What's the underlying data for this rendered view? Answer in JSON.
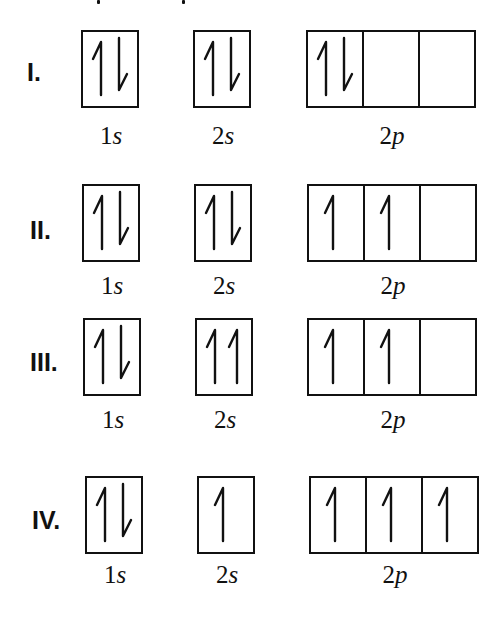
{
  "diagram": {
    "type": "orbital-box-diagram",
    "orbital_labels": [
      {
        "num": "1",
        "sub": "s"
      },
      {
        "num": "2",
        "sub": "s"
      },
      {
        "num": "2",
        "sub": "p"
      }
    ],
    "rows": [
      {
        "label": "I.",
        "orbitals": {
          "1s": [
            [
              "up",
              "down"
            ]
          ],
          "2s": [
            [
              "up",
              "down"
            ]
          ],
          "2p": [
            [
              "up",
              "down"
            ],
            [],
            []
          ]
        }
      },
      {
        "label": "II.",
        "orbitals": {
          "1s": [
            [
              "up",
              "down"
            ]
          ],
          "2s": [
            [
              "up",
              "down"
            ]
          ],
          "2p": [
            [
              "up"
            ],
            [
              "up"
            ],
            []
          ]
        }
      },
      {
        "label": "III.",
        "orbitals": {
          "1s": [
            [
              "up",
              "down"
            ]
          ],
          "2s": [
            [
              "up",
              "up"
            ]
          ],
          "2p": [
            [
              "up"
            ],
            [
              "up"
            ],
            []
          ]
        }
      },
      {
        "label": "IV.",
        "orbitals": {
          "1s": [
            [
              "up",
              "down"
            ]
          ],
          "2s": [
            [
              "up"
            ]
          ],
          "2p": [
            [
              "up"
            ],
            [
              "up"
            ],
            [
              "up"
            ]
          ]
        }
      }
    ]
  }
}
